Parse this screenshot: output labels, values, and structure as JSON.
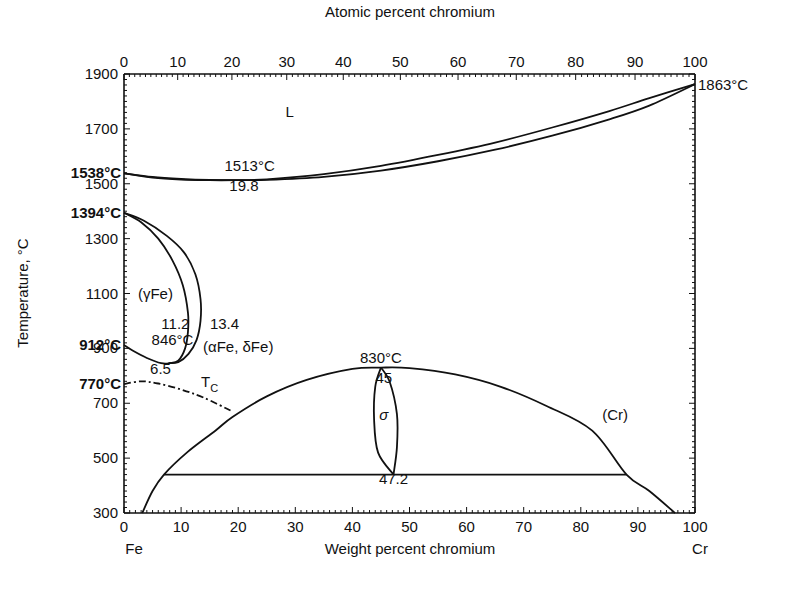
{
  "chart_data": {
    "type": "line",
    "xlabel": "Weight percent chromium",
    "x2label": "Atomic percent chromium",
    "ylabel": "Temperature, °C",
    "xlim": [
      0,
      100
    ],
    "ylim": [
      300,
      1900
    ],
    "grid": false,
    "x_ticks": [
      0,
      10,
      20,
      30,
      40,
      50,
      60,
      70,
      80,
      90,
      100
    ],
    "x2_ticks": [
      0,
      10,
      20,
      30,
      40,
      50,
      60,
      70,
      80,
      90,
      100
    ],
    "x2_tick_wt_positions": [
      0,
      9.4,
      18.9,
      28.5,
      38.4,
      48.4,
      58.5,
      68.7,
      79.1,
      89.5,
      100
    ],
    "y_ticks": [
      300,
      500,
      700,
      900,
      1100,
      1300,
      1500,
      1700,
      1900
    ],
    "x_end_labels": {
      "left": "Fe",
      "right": "Cr"
    },
    "special_temps": [
      {
        "label": "1538°C",
        "value": 1538,
        "side": "left"
      },
      {
        "label": "1394°C",
        "value": 1394,
        "side": "left"
      },
      {
        "label": "912°C",
        "value": 912,
        "side": "left"
      },
      {
        "label": "770°C",
        "value": 770,
        "side": "left"
      },
      {
        "label": "1863°C",
        "value": 1863,
        "side": "right"
      }
    ],
    "phase_labels": [
      {
        "text": "L",
        "x": 29,
        "y": 1745
      },
      {
        "text": "(γFe)",
        "x": 5.5,
        "y": 1080
      },
      {
        "text": "(αFe, δFe)",
        "x": 20,
        "y": 885
      },
      {
        "text": "σ",
        "x": 45.5,
        "y": 640
      },
      {
        "text": "(Cr)",
        "x": 86,
        "y": 640
      },
      {
        "text": "T",
        "sub": "C",
        "x": 15,
        "y": 760
      }
    ],
    "annotations": [
      {
        "text": "1513°C",
        "x": 22,
        "y": 1548
      },
      {
        "text": "19.8",
        "x": 21,
        "y": 1475
      },
      {
        "text": "11.2",
        "x": 9,
        "y": 970
      },
      {
        "text": "13.4",
        "x": 17.6,
        "y": 970
      },
      {
        "text": "846°C",
        "x": 8.5,
        "y": 912
      },
      {
        "text": "6.5",
        "x": 6.4,
        "y": 806
      },
      {
        "text": "830°C",
        "x": 45,
        "y": 845
      },
      {
        "text": "45",
        "x": 45.5,
        "y": 775
      },
      {
        "text": "47.2",
        "x": 47.2,
        "y": 405
      }
    ],
    "series": [
      {
        "name": "liquidus",
        "style": "solid",
        "points": [
          [
            0,
            1538
          ],
          [
            5,
            1525
          ],
          [
            10,
            1518
          ],
          [
            15,
            1514
          ],
          [
            19.8,
            1513
          ],
          [
            25,
            1516
          ],
          [
            35,
            1535
          ],
          [
            45,
            1565
          ],
          [
            55,
            1605
          ],
          [
            65,
            1650
          ],
          [
            75,
            1705
          ],
          [
            85,
            1765
          ],
          [
            92,
            1812
          ],
          [
            100,
            1863
          ]
        ]
      },
      {
        "name": "solidus",
        "style": "solid",
        "points": [
          [
            0,
            1538
          ],
          [
            5,
            1522
          ],
          [
            10,
            1515
          ],
          [
            15,
            1513
          ],
          [
            19.8,
            1513
          ],
          [
            25,
            1514
          ],
          [
            35,
            1525
          ],
          [
            45,
            1548
          ],
          [
            55,
            1582
          ],
          [
            65,
            1624
          ],
          [
            75,
            1675
          ],
          [
            85,
            1735
          ],
          [
            92,
            1785
          ],
          [
            100,
            1863
          ]
        ]
      },
      {
        "name": "gamma-loop-inner",
        "style": "solid",
        "points": [
          [
            0,
            1394
          ],
          [
            3,
            1360
          ],
          [
            6,
            1300
          ],
          [
            8.5,
            1220
          ],
          [
            10.3,
            1130
          ],
          [
            11.2,
            1030
          ],
          [
            11.2,
            960
          ],
          [
            10.7,
            900
          ],
          [
            9.5,
            855
          ],
          [
            8,
            846
          ],
          [
            6.5,
            846
          ],
          [
            4,
            865
          ],
          [
            1.5,
            892
          ],
          [
            0,
            912
          ]
        ]
      },
      {
        "name": "gamma-loop-outer",
        "style": "solid",
        "points": [
          [
            0,
            1394
          ],
          [
            3.5,
            1365
          ],
          [
            7.5,
            1310
          ],
          [
            10.5,
            1250
          ],
          [
            12.5,
            1170
          ],
          [
            13.4,
            1080
          ],
          [
            13.4,
            1000
          ],
          [
            12.7,
            930
          ],
          [
            11.3,
            880
          ],
          [
            9.5,
            850
          ],
          [
            7.8,
            846
          ]
        ]
      },
      {
        "name": "curie-temperature",
        "style": "dashdot",
        "points": [
          [
            0,
            770
          ],
          [
            3,
            780
          ],
          [
            6,
            772
          ],
          [
            10,
            750
          ],
          [
            14,
            720
          ],
          [
            19,
            670
          ]
        ]
      },
      {
        "name": "sigma-solvus",
        "style": "solid",
        "points": [
          [
            3.2,
            300
          ],
          [
            5,
            380
          ],
          [
            7,
            440
          ],
          [
            11,
            520
          ],
          [
            16,
            600
          ],
          [
            19,
            650
          ],
          [
            25,
            725
          ],
          [
            32,
            785
          ],
          [
            40,
            825
          ],
          [
            45,
            830
          ],
          [
            50,
            828
          ],
          [
            58,
            805
          ],
          [
            66,
            760
          ],
          [
            74,
            690
          ],
          [
            82,
            600
          ],
          [
            88,
            440
          ],
          [
            92,
            380
          ],
          [
            96.5,
            300
          ]
        ]
      },
      {
        "name": "sigma-phase-left",
        "style": "solid",
        "points": [
          [
            45,
            830
          ],
          [
            44,
            760
          ],
          [
            43.8,
            640
          ],
          [
            44.5,
            520
          ],
          [
            47.2,
            440
          ]
        ]
      },
      {
        "name": "sigma-phase-right",
        "style": "solid",
        "points": [
          [
            45,
            830
          ],
          [
            46.5,
            780
          ],
          [
            47.8,
            660
          ],
          [
            47.8,
            540
          ],
          [
            47.2,
            440
          ]
        ]
      },
      {
        "name": "eutectoid-isotherm",
        "style": "solid",
        "points": [
          [
            7,
            440
          ],
          [
            88,
            440
          ]
        ]
      }
    ]
  }
}
